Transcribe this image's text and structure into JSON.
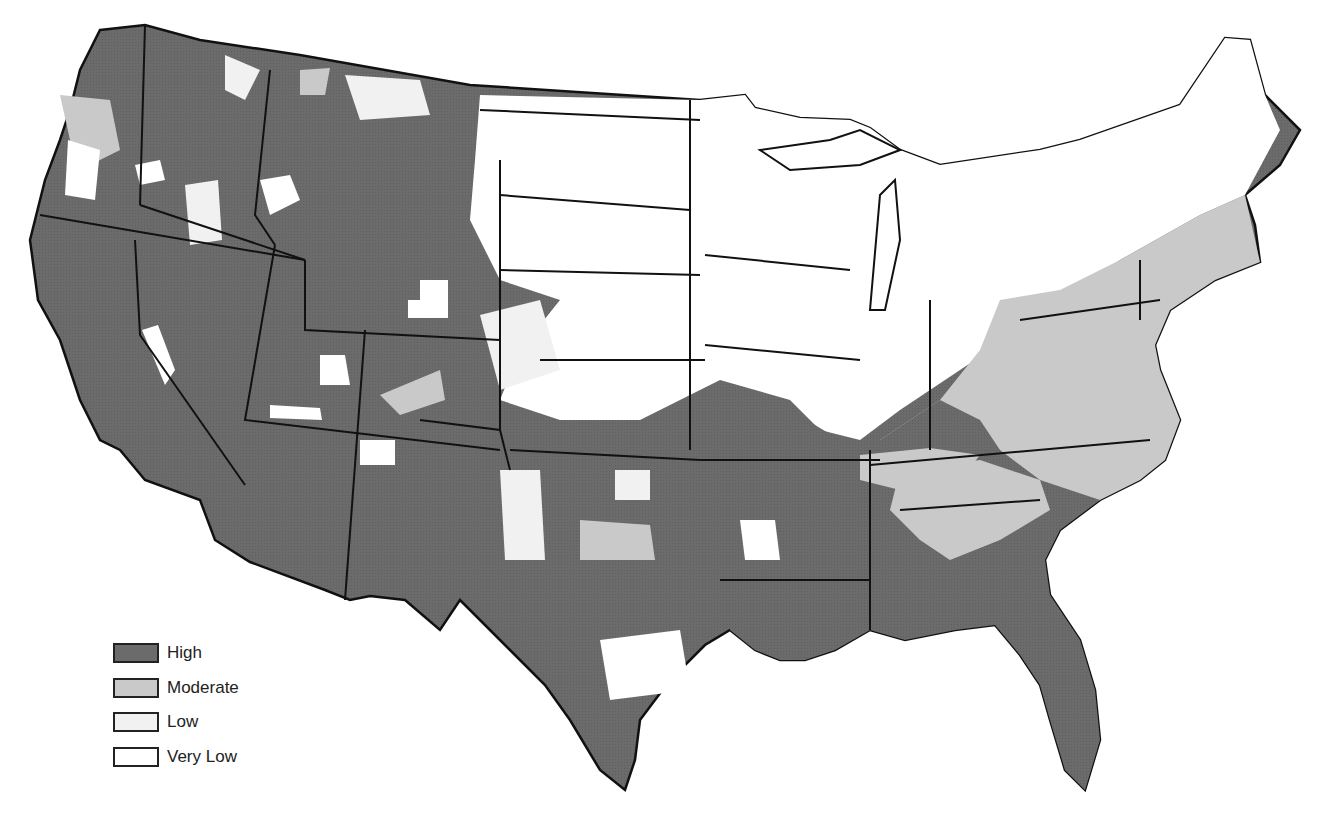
{
  "map": {
    "region": "Contiguous United States (county level)",
    "type": "choropleth",
    "colors": {
      "high": "#6b6b6b",
      "moderate": "#c9c9c9",
      "low": "#f1f1f1",
      "very_low": "#ffffff",
      "border_state": "#111111",
      "border_county": "#3a3a3a"
    }
  },
  "legend": {
    "items": [
      {
        "label": "High",
        "color": "#6b6b6b"
      },
      {
        "label": "Moderate",
        "color": "#c9c9c9"
      },
      {
        "label": "Low",
        "color": "#f1f1f1"
      },
      {
        "label": "Very Low",
        "color": "#ffffff"
      }
    ]
  },
  "regions": {
    "west": "High",
    "southwest": "High",
    "northern_plains": "Very Low",
    "midwest": "Very Low",
    "southeast": "High",
    "appalachia_mid_atlantic": "Moderate",
    "northeast": "Moderate",
    "new_england_north": "Very Low"
  }
}
